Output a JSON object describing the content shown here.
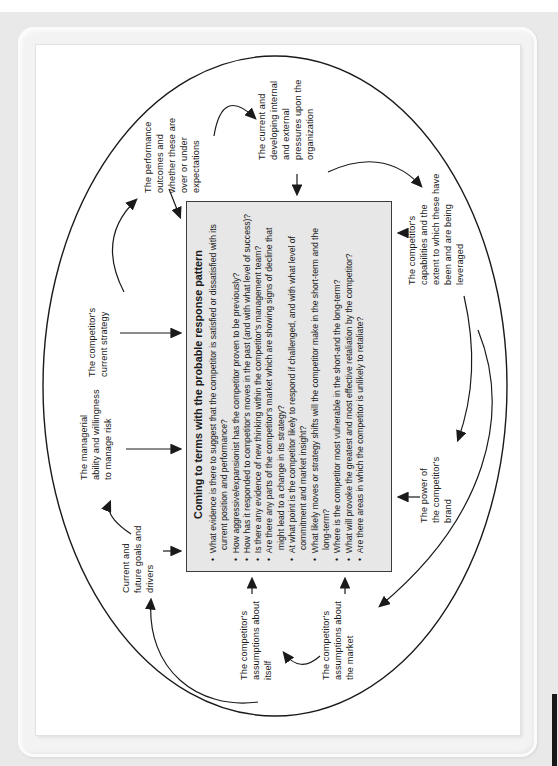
{
  "figure": {
    "box": {
      "title": "Coming to terms with the probable response pattern",
      "bullets": [
        "What evidence is there to suggest that the competitor is satisfied or dissatisfied with its current position and performance?",
        "How aggressive/expansionist has the competitor proven to be previously?",
        "How has it responded to competitor's moves in the past (and with what level of success)?",
        "Is there any evidence of new thinking within the competitor's management team?",
        "Are there any parts of the competitor's market which are showing signs of decline that might lead to a change in its strategy?",
        "At what point is the competitor likely to respond if challenged, and with what level of commitment and market insight?",
        "What likely moves or strategy shifts will the competitor make in the short-term and the long-term?",
        "Where is the competitor most vulnerable in the short-and the long-term?",
        "What will provoke the greatest and most effective retaliation by the competitor?",
        "Are there areas in which the competitor is unlikely to retaliate?"
      ]
    },
    "labels": {
      "current_strategy": "The competitor's\ncurrent strategy",
      "performance_outcomes": "The performance\noutcomes and\nwhether these are\nover or under\nexpectations",
      "pressures": "The current and\ndeveloping internal\nand external\npressures upon the\norganization",
      "capabilities": "The competitor's\ncapabilities and the\nextent to which these have\nbeen and are being\nleveraged",
      "brand_power": "The power of\nthe competitor's\nbrand",
      "assumptions_market": "The competitor's\nassumptions about\nthe market",
      "assumptions_itself": "The competitor's\nassumptions about\nitself",
      "goals_drivers": "Current and\nfuture goals and\ndrivers",
      "managerial_ability": "The managerial\nability and willingness\nto manage risk"
    },
    "colors": {
      "line": "#1a1a1a",
      "box_fill": "#e7e7e7",
      "page": "#ffffff",
      "margin": "#e9e9e9"
    }
  }
}
